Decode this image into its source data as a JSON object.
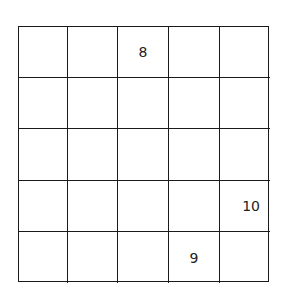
{
  "puzzle": {
    "rows": 5,
    "cols": 5,
    "cells": [
      [
        "",
        "",
        "8",
        "",
        ""
      ],
      [
        "",
        "",
        "",
        "",
        ""
      ],
      [
        "",
        "",
        "",
        "",
        ""
      ],
      [
        "",
        "",
        "",
        "",
        "10"
      ],
      [
        "",
        "",
        "",
        "9",
        ""
      ]
    ],
    "clues": [
      {
        "row": 0,
        "col": 2,
        "value": "8"
      },
      {
        "row": 3,
        "col": 4,
        "value": "10"
      },
      {
        "row": 4,
        "col": 3,
        "value": "9"
      }
    ]
  }
}
